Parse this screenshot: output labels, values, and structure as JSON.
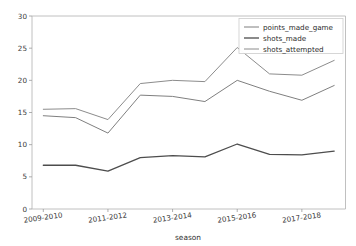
{
  "figure": {
    "cut_off_top_text": "",
    "background": "#ffffff"
  },
  "chart_data": {
    "type": "line",
    "title": "",
    "xlabel": "season",
    "ylabel": "",
    "x": [
      "2009-2010",
      "2010-2011",
      "2011-2012",
      "2012-2013",
      "2013-2014",
      "2014-2015",
      "2015-2016",
      "2016-2017",
      "2017-2018",
      "2018-2019"
    ],
    "categories": [
      "2009-2010",
      "2010-2011",
      "2011-2012",
      "2012-2013",
      "2013-2014",
      "2014-2015",
      "2015-2016",
      "2016-2017",
      "2017-2018",
      "2018-2019"
    ],
    "xtick_labels": [
      "2009-2010",
      "2011-2012",
      "2013-2014",
      "2015-2016",
      "2017-2018"
    ],
    "xtick_indices": [
      0,
      2,
      4,
      6,
      8
    ],
    "ytick_labels": [
      "0",
      "5",
      "10",
      "15",
      "20",
      "25",
      "30"
    ],
    "yticks": [
      0,
      5,
      10,
      15,
      20,
      25,
      30
    ],
    "ylim": [
      0,
      30
    ],
    "xlim": [
      -0.35,
      9.35
    ],
    "grid": false,
    "legend_position": "upper right",
    "series": [
      {
        "name": "points_made_game",
        "color": "#7f7f7f",
        "width": 1.0,
        "values": [
          14.5,
          14.2,
          11.8,
          17.7,
          17.5,
          16.7,
          20.0,
          18.3,
          16.9,
          19.2
        ]
      },
      {
        "name": "shots_made",
        "color": "#4d4d4d",
        "width": 1.3,
        "values": [
          6.8,
          6.8,
          5.9,
          8.0,
          8.3,
          8.1,
          10.1,
          8.5,
          8.4,
          9.0
        ]
      },
      {
        "name": "shots_attempted",
        "color": "#8c8c8c",
        "width": 1.0,
        "values": [
          15.5,
          15.6,
          13.9,
          19.5,
          20.0,
          19.8,
          25.1,
          21.0,
          20.8,
          23.1
        ]
      }
    ]
  },
  "legend": {
    "entries": [
      {
        "label": "points_made_game"
      },
      {
        "label": "shots_made"
      },
      {
        "label": "shots_attempted"
      }
    ]
  },
  "axis": {
    "xlabel": "season"
  }
}
